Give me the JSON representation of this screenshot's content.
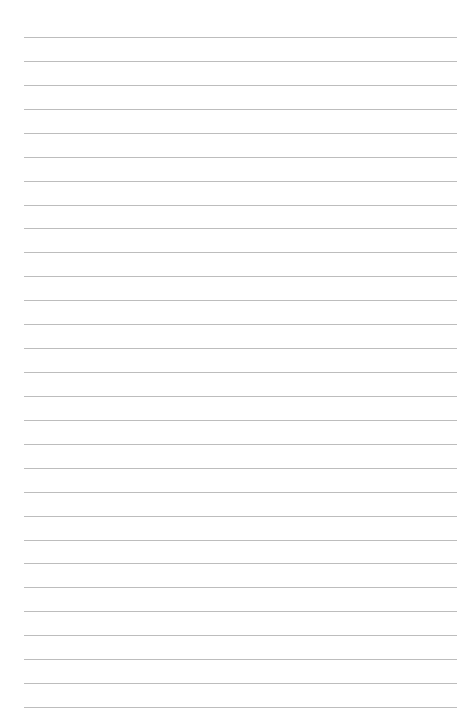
{
  "page": {
    "type": "lined-paper",
    "background": "#ffffff",
    "rule_color": "#bdbdbd",
    "rule_count": 29,
    "first_rule_y": 37,
    "last_rule_y": 707,
    "rule_left": 24,
    "rule_right": 457
  }
}
